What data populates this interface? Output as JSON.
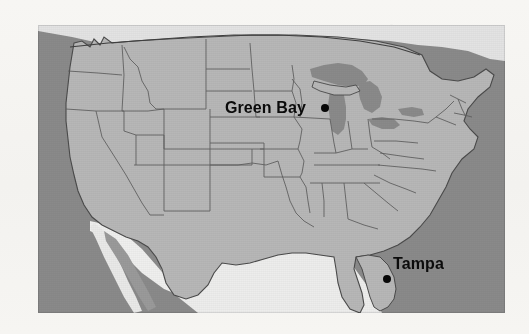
{
  "image": {
    "kind": "map",
    "subject": "United States reference map",
    "width": 529,
    "height": 334,
    "background_color": "#f6f5f2",
    "rendering": "grayscale scanned print"
  },
  "map": {
    "region": "Contiguous United States",
    "projection_look": "conic, curved northern border",
    "frame": {
      "left": 38,
      "top": 25,
      "width": 467,
      "height": 288
    },
    "colors": {
      "us_land": "#b5b5b5",
      "water": "#8a8a8a",
      "foreign_land": "#e8e8e8",
      "state_border": "#5a5a5a",
      "country_border": "#3d3d3d",
      "marker": "#080808",
      "label_text": "#0b0b0b"
    },
    "features": {
      "state_borders_visible": true,
      "great_lakes_visible": true,
      "gulf_of_mexico_visible": true,
      "baja_california_visible": true,
      "labels_shown": [
        "Green Bay",
        "Tampa"
      ]
    }
  },
  "markers": [
    {
      "name": "green-bay",
      "label": "Green Bay",
      "state": "Wisconsin",
      "dot": {
        "x": 325,
        "y": 108,
        "diameter": 8
      },
      "label_position": "left-of-dot"
    },
    {
      "name": "tampa",
      "label": "Tampa",
      "state": "Florida",
      "dot": {
        "x": 387,
        "y": 279,
        "diameter": 8
      },
      "label_position": "above-right-of-dot"
    }
  ]
}
